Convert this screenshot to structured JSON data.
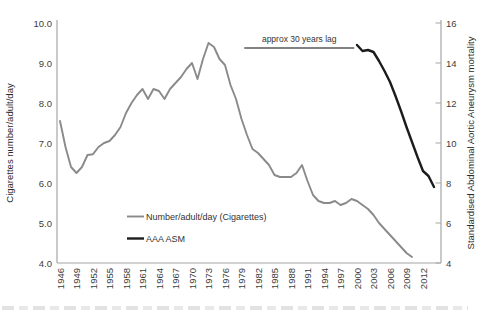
{
  "figure": {
    "background": "#ffffff"
  },
  "chart_data": {
    "type": "line",
    "title": "",
    "left_axis": {
      "label": "Cigarettes number/adult/day",
      "ticks": [
        "10.0",
        "9.0",
        "8.0",
        "7.0",
        "6.0",
        "5.0",
        "4.0"
      ],
      "min": 4.0,
      "max": 10.0
    },
    "right_axis": {
      "label": "Standardised Abdominal Aortic Aneurysm mortality",
      "ticks": [
        "16",
        "14",
        "12",
        "10",
        "8",
        "6",
        "4"
      ],
      "min": 4,
      "max": 16
    },
    "x_axis": {
      "tick_years": [
        "1946",
        "1949",
        "1952",
        "1955",
        "1958",
        "1961",
        "1964",
        "1967",
        "1970",
        "1973",
        "1976",
        "1979",
        "1982",
        "1985",
        "1988",
        "1991",
        "1994",
        "1997",
        "2000",
        "2003",
        "2006",
        "2009",
        "2012"
      ],
      "min_year": 1946,
      "max_year": 2015
    },
    "grid": "off",
    "legend_position": "center-left-inside",
    "series": [
      {
        "name": "Number/adult/day (Cigarettes)",
        "axis": "left",
        "color": "#8a8a8a",
        "stroke_width": 1.9,
        "start_year": 1946,
        "values": [
          7.55,
          6.9,
          6.4,
          6.25,
          6.4,
          6.7,
          6.72,
          6.9,
          7.0,
          7.05,
          7.2,
          7.4,
          7.75,
          8.0,
          8.2,
          8.35,
          8.1,
          8.35,
          8.3,
          8.1,
          8.35,
          8.5,
          8.65,
          8.85,
          9.0,
          8.6,
          9.1,
          9.5,
          9.4,
          9.1,
          8.95,
          8.45,
          8.1,
          7.6,
          7.2,
          6.85,
          6.75,
          6.6,
          6.45,
          6.2,
          6.15,
          6.15,
          6.15,
          6.25,
          6.45,
          6.05,
          5.7,
          5.55,
          5.5,
          5.5,
          5.55,
          5.45,
          5.5,
          5.6,
          5.55,
          5.45,
          5.35,
          5.2,
          5.0,
          4.85,
          4.7,
          4.55,
          4.4,
          4.25,
          4.15
        ]
      },
      {
        "name": "AAA ASM",
        "axis": "right",
        "color": "#1c1c1c",
        "stroke_width": 2.4,
        "start_year": 2000,
        "values": [
          14.9,
          14.6,
          14.65,
          14.55,
          14.1,
          13.6,
          13.05,
          12.35,
          11.6,
          10.8,
          10.05,
          9.3,
          8.6,
          8.35,
          7.8
        ]
      }
    ],
    "annotation": {
      "label": "approx 30 years lag",
      "year_start": 1979.5,
      "year_end": 1999.5,
      "right_axis_value": 14.75,
      "line_color": "#595959"
    }
  }
}
